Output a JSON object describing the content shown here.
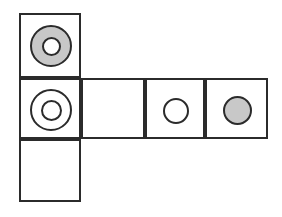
{
  "figure": {
    "canvas": {
      "width": 282,
      "height": 217,
      "background": "#ffffff"
    },
    "colors": {
      "stroke": "#2b2b2b",
      "cell_fill": "#ffffff",
      "shape_fill_gray": "#c8c8c8",
      "shape_fill_white": "#ffffff"
    },
    "grid": {
      "line_width": 2,
      "columns_x": [
        19,
        81,
        145,
        205,
        268
      ],
      "rows_y": [
        13,
        78,
        139,
        202
      ]
    },
    "cells": [
      {
        "id": "cell-r1c1",
        "name": "top-left-cell",
        "x": 19,
        "y": 13,
        "width": 62,
        "height": 65,
        "contents": "gray-annulus"
      },
      {
        "id": "cell-r2c1",
        "name": "middle-left-cell",
        "x": 19,
        "y": 78,
        "width": 62,
        "height": 61,
        "contents": "white-annulus"
      },
      {
        "id": "cell-r3c1",
        "name": "bottom-left-cell",
        "x": 19,
        "y": 139,
        "width": 62,
        "height": 63,
        "contents": "empty"
      },
      {
        "id": "cell-r2c2",
        "name": "middle-row-cell-2",
        "x": 81,
        "y": 78,
        "width": 64,
        "height": 61,
        "contents": "empty"
      },
      {
        "id": "cell-r2c3",
        "name": "middle-row-cell-3",
        "x": 145,
        "y": 78,
        "width": 60,
        "height": 61,
        "contents": "white-circle"
      },
      {
        "id": "cell-r2c4",
        "name": "middle-row-cell-4",
        "x": 205,
        "y": 78,
        "width": 63,
        "height": 61,
        "contents": "gray-circle"
      }
    ],
    "shapes": [
      {
        "id": "shape-gray-annulus",
        "name": "gray-annulus",
        "type": "annulus",
        "cx": 50,
        "cy": 45,
        "outer_diameter": 42,
        "inner_diameter": 19,
        "fill": "#c8c8c8",
        "inner_fill": "#ffffff",
        "stroke": "#2b2b2b",
        "stroke_width": 2
      },
      {
        "id": "shape-white-annulus",
        "name": "white-annulus",
        "type": "annulus",
        "cx": 50,
        "cy": 109,
        "outer_diameter": 42,
        "inner_diameter": 21,
        "fill": "#ffffff",
        "inner_fill": "#ffffff",
        "stroke": "#2b2b2b",
        "stroke_width": 2
      },
      {
        "id": "shape-white-circle",
        "name": "white-circle",
        "type": "circle",
        "cx": 175,
        "cy": 110,
        "diameter": 26,
        "fill": "#ffffff",
        "stroke": "#2b2b2b",
        "stroke_width": 2
      },
      {
        "id": "shape-gray-circle",
        "name": "gray-circle",
        "type": "circle",
        "cx": 236,
        "cy": 109,
        "diameter": 29,
        "fill": "#c8c8c8",
        "stroke": "#2b2b2b",
        "stroke_width": 2
      }
    ]
  }
}
